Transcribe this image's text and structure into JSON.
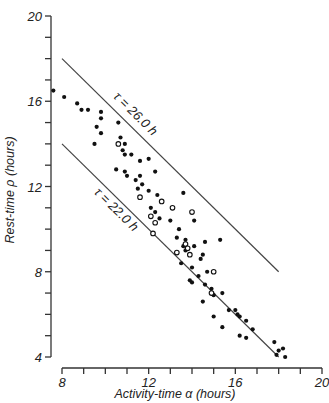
{
  "chart_data": {
    "type": "scatter",
    "title": "",
    "xlabel": "Activity-time α (hours)",
    "ylabel": "Rest-time ρ (hours)",
    "xlim": [
      8,
      20
    ],
    "ylim": [
      4,
      20
    ],
    "x_ticks": [
      8,
      12,
      16,
      20
    ],
    "y_ticks": [
      4,
      8,
      12,
      16,
      20
    ],
    "grid": false,
    "legend": "none",
    "annotations": [
      {
        "text": "τ = 26.0 h",
        "line": {
          "x": [
            8,
            18
          ],
          "y": [
            18,
            8
          ]
        }
      },
      {
        "text": "τ = 22.0 h",
        "line": {
          "x": [
            8,
            18
          ],
          "y": [
            14,
            4
          ]
        }
      }
    ],
    "series": [
      {
        "name": "filled",
        "marker": "filled-circle",
        "points": [
          [
            7.6,
            16.5
          ],
          [
            8.1,
            16.2
          ],
          [
            8.7,
            15.9
          ],
          [
            8.9,
            15.6
          ],
          [
            9.2,
            15.6
          ],
          [
            9.8,
            15.5
          ],
          [
            9.8,
            15.2
          ],
          [
            9.6,
            14.8
          ],
          [
            9.8,
            14.5
          ],
          [
            9.5,
            14.0
          ],
          [
            10.6,
            15.0
          ],
          [
            10.7,
            14.3
          ],
          [
            10.9,
            14.0
          ],
          [
            10.8,
            13.7
          ],
          [
            10.9,
            13.5
          ],
          [
            11.2,
            13.5
          ],
          [
            11.6,
            13.2
          ],
          [
            12.0,
            13.3
          ],
          [
            11.0,
            12.5
          ],
          [
            11.4,
            12.3
          ],
          [
            11.6,
            12.5
          ],
          [
            10.5,
            12.8
          ],
          [
            10.9,
            12.7
          ],
          [
            12.3,
            12.7
          ],
          [
            11.7,
            12.1
          ],
          [
            11.5,
            11.9
          ],
          [
            12.0,
            11.8
          ],
          [
            12.4,
            11.6
          ],
          [
            13.6,
            11.7
          ],
          [
            12.1,
            11.0
          ],
          [
            12.3,
            10.8
          ],
          [
            12.5,
            10.5
          ],
          [
            13.0,
            10.4
          ],
          [
            13.4,
            10.0
          ],
          [
            13.7,
            9.5
          ],
          [
            14.1,
            10.4
          ],
          [
            14.6,
            9.4
          ],
          [
            13.3,
            9.6
          ],
          [
            13.6,
            9.2
          ],
          [
            13.7,
            9.0
          ],
          [
            14.1,
            9.2
          ],
          [
            13.9,
            8.8
          ],
          [
            14.4,
            8.6
          ],
          [
            14.5,
            8.8
          ],
          [
            13.5,
            8.4
          ],
          [
            14.0,
            8.2
          ],
          [
            14.7,
            8.0
          ],
          [
            14.3,
            7.8
          ],
          [
            14.0,
            7.5
          ],
          [
            15.3,
            9.5
          ],
          [
            14.9,
            7.2
          ],
          [
            13.9,
            7.6
          ],
          [
            14.6,
            7.4
          ],
          [
            15.0,
            6.9
          ],
          [
            14.5,
            6.6
          ],
          [
            15.4,
            7.0
          ],
          [
            15.7,
            6.2
          ],
          [
            15.0,
            5.9
          ],
          [
            16.0,
            6.2
          ],
          [
            16.2,
            5.9
          ],
          [
            16.1,
            6.0
          ],
          [
            16.5,
            5.7
          ],
          [
            15.4,
            5.4
          ],
          [
            16.2,
            5.0
          ],
          [
            16.8,
            5.3
          ],
          [
            16.5,
            4.9
          ],
          [
            17.8,
            4.7
          ],
          [
            17.9,
            4.1
          ],
          [
            18.0,
            4.3
          ],
          [
            18.3,
            4.0
          ],
          [
            18.2,
            4.4
          ]
        ]
      },
      {
        "name": "open",
        "marker": "open-circle",
        "points": [
          [
            10.6,
            14.0
          ],
          [
            11.6,
            11.5
          ],
          [
            12.1,
            10.6
          ],
          [
            12.3,
            10.3
          ],
          [
            12.6,
            11.3
          ],
          [
            13.1,
            11.0
          ],
          [
            14.0,
            10.8
          ],
          [
            13.7,
            9.3
          ],
          [
            13.8,
            9.1
          ],
          [
            13.9,
            8.8
          ],
          [
            13.3,
            8.9
          ],
          [
            15.0,
            8.0
          ],
          [
            14.9,
            7.0
          ],
          [
            12.2,
            9.8
          ]
        ]
      }
    ]
  }
}
